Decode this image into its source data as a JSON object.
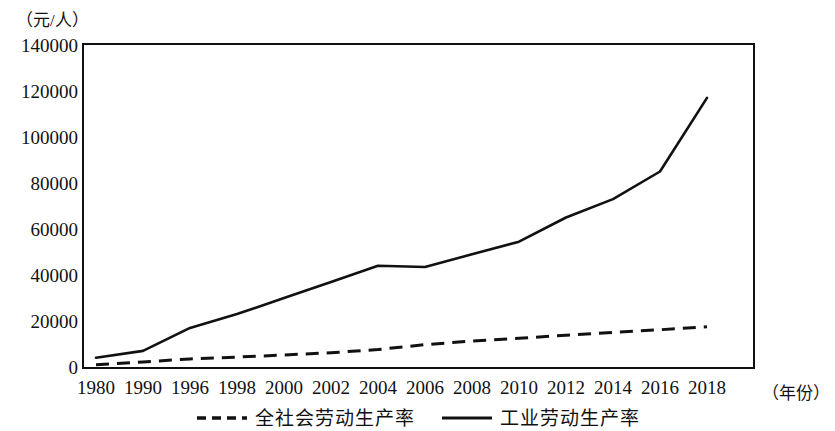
{
  "axis": {
    "y_unit_label": "（元/人）",
    "x_unit_label": "（年份）"
  },
  "legend": {
    "items": [
      {
        "label": "全社会劳动生产率",
        "style": "dashed"
      },
      {
        "label": "工业劳动生产率",
        "style": "solid"
      }
    ]
  },
  "colors": {
    "line": "#111111",
    "frame": "#111111",
    "background": "#ffffff"
  },
  "chart_data": {
    "type": "line",
    "title": "",
    "subtitle": "",
    "xlabel": "（年份）",
    "ylabel": "（元/人）",
    "categories": [
      "1980",
      "1990",
      "1996",
      "1998",
      "2000",
      "2002",
      "2004",
      "2006",
      "2008",
      "2010",
      "2012",
      "2014",
      "2016",
      "2018"
    ],
    "ylim": [
      0,
      140000
    ],
    "ytick_labels": [
      "0",
      "20000",
      "40000",
      "60000",
      "80000",
      "100000",
      "120000",
      "140000"
    ],
    "ytick_values": [
      0,
      20000,
      40000,
      60000,
      80000,
      100000,
      120000,
      140000
    ],
    "grid": false,
    "legend_position": "bottom",
    "series": [
      {
        "name": "全社会劳动生产率",
        "style": "dashed",
        "values": [
          1000,
          2200,
          3500,
          4300,
          5200,
          6200,
          7600,
          9700,
          11300,
          12500,
          13800,
          15000,
          16200,
          17500
        ]
      },
      {
        "name": "工业劳动生产率",
        "style": "solid",
        "values": [
          4000,
          7000,
          17000,
          23000,
          30000,
          37000,
          44000,
          43500,
          49000,
          54500,
          65000,
          73000,
          85000,
          117000
        ]
      }
    ]
  }
}
